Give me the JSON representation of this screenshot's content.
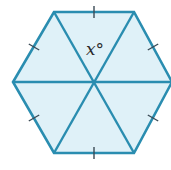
{
  "diagram": {
    "type": "regular-hexagon-divided-into-triangles",
    "colors": {
      "stroke": "#2a8db0",
      "fill": "#dff1f8",
      "tick": "#3a4a55",
      "label": "#2b2b2b"
    },
    "center": [
      94,
      82
    ],
    "vertices": [
      [
        54,
        12
      ],
      [
        134,
        12
      ],
      [
        172,
        82
      ],
      [
        134,
        153
      ],
      [
        54,
        153
      ],
      [
        13,
        82
      ]
    ],
    "ticks": [
      {
        "at": [
          94,
          12
        ],
        "angle": 90
      },
      {
        "at": [
          153,
          47
        ],
        "angle": -30
      },
      {
        "at": [
          153,
          118
        ],
        "angle": 30
      },
      {
        "at": [
          94,
          153
        ],
        "angle": 90
      },
      {
        "at": [
          34,
          118
        ],
        "angle": -30
      },
      {
        "at": [
          34,
          47
        ],
        "angle": 30
      }
    ],
    "angle_label": {
      "text": "x°",
      "position": [
        86,
        41
      ]
    }
  }
}
